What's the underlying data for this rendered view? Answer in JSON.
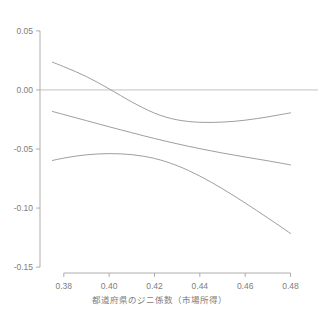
{
  "chart_data": {
    "type": "line",
    "title": "",
    "xlabel": "都道府県のジニ係数（市場所得）",
    "ylabel": "",
    "xlim": [
      0.3695,
      0.4855
    ],
    "ylim": [
      -0.155,
      0.055
    ],
    "grid": false,
    "legend_position": "none",
    "zero_reference_line": 0.0,
    "xticks": [
      "0.38",
      "0.40",
      "0.42",
      "0.44",
      "0.46",
      "0.48"
    ],
    "xtick_values": [
      0.38,
      0.4,
      0.42,
      0.44,
      0.46,
      0.48
    ],
    "yticks": [
      "0.05",
      "0.00",
      "-0.05",
      "-0.10",
      "-0.15"
    ],
    "ytick_values": [
      0.05,
      0.0,
      -0.05,
      -0.1,
      -0.15
    ],
    "line_color": "#8c8c8c",
    "axis_color": "#9a9a9a",
    "series": [
      {
        "name": "upper-confidence-band",
        "x": [
          0.375,
          0.38,
          0.385,
          0.39,
          0.395,
          0.4,
          0.405,
          0.41,
          0.415,
          0.42,
          0.425,
          0.43,
          0.435,
          0.44,
          0.445,
          0.45,
          0.455,
          0.46,
          0.465,
          0.47,
          0.475,
          0.48
        ],
        "values": [
          0.0235,
          0.0197,
          0.0157,
          0.0113,
          0.0063,
          0.0009,
          -0.0047,
          -0.0102,
          -0.0152,
          -0.0196,
          -0.023,
          -0.0253,
          -0.0267,
          -0.0274,
          -0.0275,
          -0.0272,
          -0.0266,
          -0.0256,
          -0.0243,
          -0.0228,
          -0.0211,
          -0.0194
        ]
      },
      {
        "name": "central-estimate",
        "x": [
          0.375,
          0.38,
          0.385,
          0.39,
          0.395,
          0.4,
          0.405,
          0.41,
          0.415,
          0.42,
          0.425,
          0.43,
          0.435,
          0.44,
          0.445,
          0.45,
          0.455,
          0.46,
          0.465,
          0.47,
          0.475,
          0.48
        ],
        "values": [
          -0.0182,
          -0.0208,
          -0.0234,
          -0.026,
          -0.0286,
          -0.0312,
          -0.0337,
          -0.0362,
          -0.0387,
          -0.0411,
          -0.0434,
          -0.0456,
          -0.0477,
          -0.0497,
          -0.0516,
          -0.0534,
          -0.0551,
          -0.0568,
          -0.0584,
          -0.06,
          -0.0617,
          -0.0635
        ]
      },
      {
        "name": "lower-confidence-band",
        "x": [
          0.375,
          0.38,
          0.385,
          0.39,
          0.395,
          0.4,
          0.405,
          0.41,
          0.415,
          0.42,
          0.425,
          0.43,
          0.435,
          0.44,
          0.445,
          0.45,
          0.455,
          0.46,
          0.465,
          0.47,
          0.475,
          0.48
        ],
        "values": [
          -0.0597,
          -0.0577,
          -0.0561,
          -0.0549,
          -0.0542,
          -0.0539,
          -0.0541,
          -0.0548,
          -0.0561,
          -0.058,
          -0.0607,
          -0.0641,
          -0.0682,
          -0.0729,
          -0.0781,
          -0.0837,
          -0.0896,
          -0.0957,
          -0.102,
          -0.1084,
          -0.1149,
          -0.1215
        ]
      }
    ]
  },
  "clipped_header": {
    "fragment_1": "",
    "fragment_2": "",
    "fragment_3": ""
  }
}
